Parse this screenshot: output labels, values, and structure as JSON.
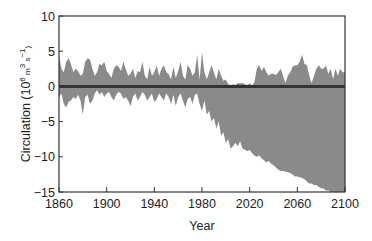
{
  "chart_data": {
    "type": "area",
    "title": "",
    "xlabel": "Year",
    "ylabel": "Circulation (10⁶ m³ s⁻¹)",
    "ylabel_parts": {
      "main": "Circulation (10",
      "sup1": "6",
      "mid": " m",
      "sup2": "3",
      "mid2": " s",
      "sup3": "−1",
      "end": ")"
    },
    "xlim": [
      1860,
      2100
    ],
    "ylim": [
      -15,
      10
    ],
    "x_ticks": [
      1860,
      1900,
      1940,
      1980,
      2020,
      2060,
      2100
    ],
    "x_tick_labels": [
      "1860",
      "1900",
      "1940",
      "1980",
      "2020",
      "2060",
      "2100"
    ],
    "y_ticks": [
      10,
      5,
      0,
      -5,
      -10,
      -15
    ],
    "y_tick_labels": [
      "10",
      "5",
      "0",
      "−5",
      "−10",
      "−15"
    ],
    "grid": false,
    "legend": null,
    "fill_color": "#8a8a8a",
    "line_color": "#333333",
    "series": [
      {
        "name": "upper envelope",
        "x": [
          1860,
          1862,
          1864,
          1866,
          1868,
          1870,
          1872,
          1874,
          1876,
          1878,
          1880,
          1882,
          1884,
          1886,
          1888,
          1890,
          1892,
          1894,
          1896,
          1898,
          1900,
          1902,
          1904,
          1906,
          1908,
          1910,
          1912,
          1914,
          1916,
          1918,
          1920,
          1922,
          1924,
          1926,
          1928,
          1930,
          1932,
          1934,
          1936,
          1938,
          1940,
          1942,
          1944,
          1946,
          1948,
          1950,
          1952,
          1954,
          1956,
          1958,
          1960,
          1962,
          1964,
          1966,
          1968,
          1970,
          1972,
          1974,
          1976,
          1978,
          1980,
          1982,
          1984,
          1986,
          1988,
          1990,
          1992,
          1994,
          1996,
          1998,
          2000,
          2002,
          2004,
          2006,
          2008,
          2010,
          2012,
          2014,
          2016,
          2018,
          2020,
          2022,
          2024,
          2026,
          2028,
          2030,
          2032,
          2034,
          2036,
          2038,
          2040,
          2042,
          2044,
          2046,
          2048,
          2050,
          2052,
          2054,
          2056,
          2058,
          2060,
          2062,
          2064,
          2066,
          2068,
          2070,
          2072,
          2074,
          2076,
          2078,
          2080,
          2082,
          2084,
          2086,
          2088,
          2090,
          2092,
          2094,
          2096,
          2098,
          2100
        ],
        "values": [
          4.5,
          2.5,
          2.0,
          3.5,
          4.0,
          3.2,
          2.0,
          2.5,
          2.2,
          1.5,
          1.8,
          3.5,
          4.0,
          3.8,
          2.5,
          1.5,
          2.0,
          3.2,
          3.0,
          3.5,
          2.2,
          1.8,
          1.2,
          2.5,
          3.0,
          2.8,
          2.2,
          3.5,
          2.5,
          1.5,
          1.8,
          2.5,
          1.2,
          2.2,
          2.0,
          3.5,
          1.5,
          1.0,
          2.8,
          1.5,
          2.0,
          3.0,
          1.5,
          2.5,
          3.0,
          2.0,
          1.8,
          1.0,
          2.8,
          1.2,
          2.2,
          3.5,
          1.5,
          1.0,
          3.0,
          2.5,
          1.5,
          2.0,
          4.5,
          1.0,
          4.8,
          2.0,
          1.0,
          2.0,
          3.0,
          2.0,
          1.0,
          2.5,
          1.5,
          0.8,
          1.0,
          0.3,
          0.2,
          0.3,
          0.2,
          0.5,
          0.4,
          0.5,
          0.3,
          0.2,
          0.4,
          0.1,
          0.6,
          2.5,
          3.0,
          2.2,
          2.8,
          2.0,
          1.5,
          1.8,
          1.8,
          1.6,
          2.0,
          2.5,
          1.5,
          0.5,
          1.5,
          2.0,
          2.8,
          3.0,
          3.0,
          3.5,
          4.5,
          3.2,
          3.0,
          1.5,
          0.5,
          1.5,
          2.5,
          3.0,
          2.5,
          2.5,
          3.0,
          1.8,
          2.5,
          1.0,
          2.5,
          1.5,
          2.5,
          2.0,
          2.0
        ]
      },
      {
        "name": "lower envelope",
        "x": [
          1860,
          1862,
          1864,
          1866,
          1868,
          1870,
          1872,
          1874,
          1876,
          1878,
          1880,
          1882,
          1884,
          1886,
          1888,
          1890,
          1892,
          1894,
          1896,
          1898,
          1900,
          1902,
          1904,
          1906,
          1908,
          1910,
          1912,
          1914,
          1916,
          1918,
          1920,
          1922,
          1924,
          1926,
          1928,
          1930,
          1932,
          1934,
          1936,
          1938,
          1940,
          1942,
          1944,
          1946,
          1948,
          1950,
          1952,
          1954,
          1956,
          1958,
          1960,
          1962,
          1964,
          1966,
          1968,
          1970,
          1972,
          1974,
          1976,
          1978,
          1980,
          1982,
          1984,
          1986,
          1988,
          1990,
          1992,
          1994,
          1996,
          1998,
          2000,
          2002,
          2004,
          2006,
          2008,
          2010,
          2012,
          2014,
          2016,
          2018,
          2020,
          2022,
          2024,
          2026,
          2028,
          2030,
          2032,
          2034,
          2036,
          2038,
          2040,
          2042,
          2044,
          2046,
          2048,
          2050,
          2052,
          2054,
          2056,
          2058,
          2060,
          2062,
          2064,
          2066,
          2068,
          2070,
          2072,
          2074,
          2076,
          2078,
          2080,
          2082,
          2084,
          2086,
          2088,
          2090,
          2092,
          2094,
          2096,
          2098,
          2100
        ],
        "values": [
          -1.5,
          -1.0,
          -2.5,
          -3.0,
          -2.2,
          -2.0,
          -1.5,
          -1.8,
          -1.2,
          -2.0,
          -4.0,
          -1.5,
          -1.2,
          -2.5,
          -2.0,
          -1.0,
          -0.5,
          -1.2,
          -0.8,
          -1.5,
          -1.0,
          -0.8,
          -1.5,
          -2.0,
          -1.2,
          -0.8,
          -1.0,
          -1.8,
          -1.5,
          -2.0,
          -2.8,
          -1.5,
          -1.0,
          -2.0,
          -1.5,
          -0.8,
          -1.2,
          -2.0,
          -1.5,
          -1.0,
          -2.2,
          -1.8,
          -1.0,
          -1.5,
          -2.0,
          -1.0,
          -1.5,
          -2.5,
          -1.2,
          -2.8,
          -1.5,
          -1.0,
          -2.0,
          -3.0,
          -1.8,
          -1.5,
          -2.5,
          -1.2,
          -1.0,
          -2.5,
          -3.5,
          -2.0,
          -4.0,
          -3.5,
          -5.0,
          -4.5,
          -6.0,
          -5.0,
          -7.0,
          -6.5,
          -8.0,
          -7.5,
          -8.8,
          -8.5,
          -8.0,
          -8.5,
          -7.8,
          -8.8,
          -9.0,
          -9.2,
          -9.0,
          -9.5,
          -9.8,
          -10.0,
          -9.8,
          -10.2,
          -10.5,
          -10.8,
          -10.6,
          -11.0,
          -11.2,
          -11.5,
          -11.8,
          -12.0,
          -12.0,
          -12.1,
          -12.2,
          -12.3,
          -12.5,
          -12.8,
          -12.8,
          -12.9,
          -13.0,
          -13.2,
          -13.5,
          -13.8,
          -13.8,
          -14.0,
          -14.0,
          -14.3,
          -14.5,
          -14.5,
          -14.8,
          -14.8,
          -15.0,
          -15.2,
          -15.3,
          -15.5,
          -15.5,
          -15.8,
          -16.0
        ]
      },
      {
        "name": "zero reference line",
        "x": [
          1860,
          2100
        ],
        "values": [
          0,
          0
        ]
      }
    ]
  }
}
